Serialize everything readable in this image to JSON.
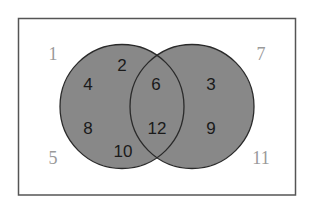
{
  "colors": {
    "circle_fill": "#888888",
    "circle_stroke": "#2a2a2a",
    "frame_stroke": "#555555",
    "inside_text": "#1a1a1a",
    "outside_text": "#9a9a9a"
  },
  "universe": {
    "outside_numbers": [
      "1",
      "5",
      "7",
      "11"
    ]
  },
  "set_a": {
    "only": [
      "2",
      "4",
      "8",
      "10"
    ]
  },
  "set_b": {
    "only": [
      "3",
      "9"
    ]
  },
  "intersection": [
    "6",
    "12"
  ],
  "labels": {
    "n1": "1",
    "n2": "2",
    "n3": "3",
    "n4": "4",
    "n5": "5",
    "n6": "6",
    "n7": "7",
    "n8": "8",
    "n9": "9",
    "n10": "10",
    "n11": "11",
    "n12": "12"
  }
}
